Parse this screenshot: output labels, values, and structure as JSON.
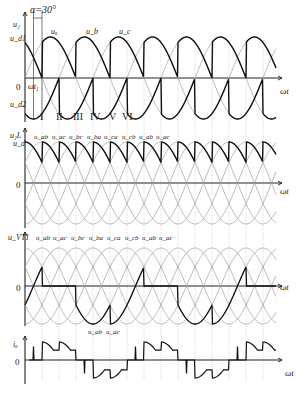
{
  "figure": {
    "alpha_label": "α=30°",
    "colors": {
      "thin_wave": "#9a9a9a",
      "thick_wave": "#111111",
      "axis": "#222222",
      "grid": "#b5b5b5"
    }
  },
  "panels": [
    {
      "id": "phase-voltages",
      "ylabel": "u₂",
      "ylabel_upper": "u_d1",
      "ylabel_lower": "u_d2",
      "origin_label": "0",
      "xlabel": "ωt",
      "wt1_label": "ωt₁",
      "curve_labels": [
        "uₐ",
        "u_b",
        "u_c"
      ],
      "interval_labels": [
        "I",
        "II",
        "III",
        "IV",
        "V",
        "VI"
      ]
    },
    {
      "id": "output-voltage",
      "ylabel": "u₂L",
      "ylabel_sub": "u_d",
      "origin_label": "0",
      "xlabel": "ωt",
      "segment_labels": [
        "u_ab",
        "u_ac",
        "u_bc",
        "u_ba",
        "u_ca",
        "u_cb",
        "u_ab",
        "u_ac"
      ]
    },
    {
      "id": "thyristor-voltage",
      "ylabel": "u_VT1",
      "origin_label": "0",
      "xlabel": "ωt",
      "segment_labels": [
        "u_ab",
        "u_ac",
        "u_bc",
        "u_ba",
        "u_ca",
        "u_cb",
        "u_ab",
        "u_ac"
      ],
      "bottom_labels": [
        "u_ab",
        "u_ac"
      ]
    },
    {
      "id": "phase-current",
      "ylabel": "iₐ",
      "origin_label": "0",
      "xlabel": "ωt"
    }
  ]
}
